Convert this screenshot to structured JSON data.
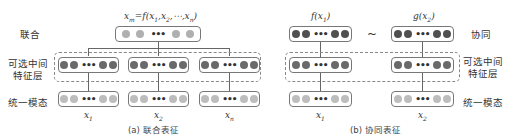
{
  "colors": {
    "joint_dot": "#b0b0b0",
    "feature_dot": "#6a6a6a",
    "input_dot": "#bdbdbd",
    "coord_dot": "#505050",
    "box_border": "#777777",
    "dash_border": "#888888"
  },
  "left": {
    "row_labels": {
      "joint": "联合",
      "feature_line1": "可选中间",
      "feature_line2": "特征层",
      "modal": "统一模态"
    },
    "formula": "x_m = f(x_1, x_2, ⋯, x_n)",
    "formula_parts": {
      "lhs": "x",
      "lhs_sub": "m",
      "eq": "=f(",
      "x1": "x",
      "s1": "1",
      "x2": ",x",
      "s2": "2",
      "rest": ",⋯,x",
      "sn": "n",
      "close": ")"
    },
    "inputs": [
      {
        "var": "x",
        "sub": "1"
      },
      {
        "var": "x",
        "sub": "2"
      },
      {
        "var": "x",
        "sub": "n"
      }
    ],
    "caption": "(a) 联合表征"
  },
  "right": {
    "row_labels": {
      "coord": "协同",
      "feature_line1": "可选中间",
      "feature_line2": "特征层",
      "modal": "统一模态"
    },
    "top_labels": [
      {
        "fn": "f(x",
        "sub": "1",
        "close": ")"
      },
      {
        "fn": "g(x",
        "sub": "2",
        "close": ")"
      }
    ],
    "similarity": "~",
    "inputs": [
      {
        "var": "x",
        "sub": "1"
      },
      {
        "var": "x",
        "sub": "2"
      }
    ],
    "caption": "(b) 协同表征"
  },
  "ellipsis": "•••"
}
